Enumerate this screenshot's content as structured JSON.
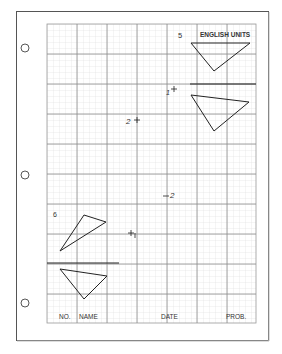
{
  "sheet": {
    "header_label": "ENGLISH UNITS",
    "problem_numbers": [
      "5",
      "6"
    ],
    "point_labels": [
      {
        "id": "p1-upper",
        "text": "1",
        "x": 170,
        "y": 91
      },
      {
        "id": "p2-upper",
        "text": "2",
        "x": 134,
        "y": 121
      },
      {
        "id": "p2-lower",
        "text": "2",
        "x": 168,
        "y": 195
      },
      {
        "id": "p1-lower",
        "text": "1",
        "x": 133,
        "y": 234
      }
    ],
    "title_block": {
      "no_label": "NO.",
      "name_label": "NAME",
      "date_label": "DATE",
      "prob_label": "PROB."
    }
  },
  "colors": {
    "paper": "#ffffff",
    "border": "#555555",
    "grid_minor": "#dcdcdc",
    "grid_major": "#8a8a8a",
    "ink": "#222222"
  }
}
